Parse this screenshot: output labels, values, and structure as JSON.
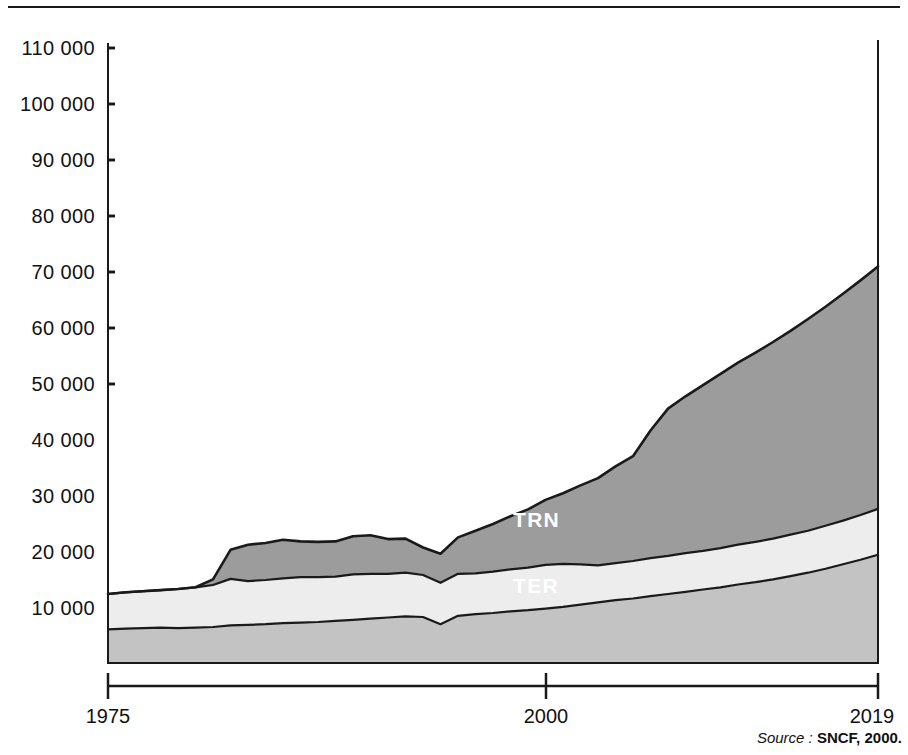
{
  "chart_data": {
    "type": "area",
    "stacked": true,
    "title": "",
    "xlabel": "",
    "ylabel": "",
    "xlim": [
      1975,
      2019
    ],
    "ylim": [
      0,
      110000
    ],
    "x_tick_labels": [
      "1975",
      "2000",
      "2019"
    ],
    "x_ticks": [
      1975,
      2000,
      2019
    ],
    "y_ticks": [
      10000,
      20000,
      30000,
      40000,
      50000,
      60000,
      70000,
      80000,
      90000,
      100000,
      110000
    ],
    "y_tick_labels": [
      "10 000",
      "20 000",
      "30 000",
      "40 000",
      "50 000",
      "60 000",
      "70 000",
      "80 000",
      "90 000",
      "100 000",
      "110 000"
    ],
    "grid": false,
    "legend_position": "inline-area-labels",
    "colors": {
      "TER": "#c3c3c3",
      "TRN": "#ededed",
      "TGV": "#9c9c9c",
      "outline": "#1a1a1a",
      "label_text": "#ffffff"
    },
    "x": [
      1975,
      1976,
      1977,
      1978,
      1979,
      1980,
      1981,
      1982,
      1983,
      1984,
      1985,
      1986,
      1987,
      1988,
      1989,
      1990,
      1991,
      1992,
      1993,
      1994,
      1995,
      1996,
      1997,
      1998,
      1999,
      2000,
      2001,
      2002,
      2003,
      2004,
      2005,
      2006,
      2007,
      2008,
      2009,
      2010,
      2011,
      2012,
      2013,
      2014,
      2015,
      2016,
      2017,
      2018,
      2019
    ],
    "series": [
      {
        "name": "TER",
        "label": "TER",
        "values": [
          6200,
          6300,
          6400,
          6500,
          6400,
          6500,
          6600,
          6900,
          7000,
          7100,
          7300,
          7400,
          7500,
          7700,
          7900,
          8100,
          8300,
          8500,
          8400,
          7100,
          8600,
          8900,
          9100,
          9400,
          9600,
          9900,
          10200,
          10600,
          11000,
          11400,
          11700,
          12100,
          12500,
          12900,
          13300,
          13700,
          14200,
          14600,
          15100,
          15700,
          16300,
          17000,
          17800,
          18600,
          19500
        ]
      },
      {
        "name": "TRN",
        "label": "TRN",
        "values": [
          6300,
          6500,
          6600,
          6700,
          7000,
          7200,
          7500,
          8300,
          7800,
          7900,
          8000,
          8100,
          8000,
          7900,
          8100,
          8000,
          7800,
          7800,
          7500,
          7400,
          7500,
          7300,
          7400,
          7500,
          7600,
          7800,
          7700,
          7200,
          6600,
          6600,
          6700,
          6800,
          6800,
          6900,
          6900,
          7000,
          7100,
          7200,
          7300,
          7400,
          7500,
          7700,
          7800,
          8000,
          8200
        ]
      },
      {
        "name": "TGV",
        "label": "TGV",
        "values": [
          0,
          0,
          0,
          0,
          0,
          0,
          1000,
          5200,
          6500,
          6600,
          6900,
          6400,
          6300,
          6300,
          6800,
          6900,
          6200,
          6100,
          4900,
          5200,
          6500,
          7600,
          8500,
          9500,
          10400,
          11600,
          12600,
          14100,
          15600,
          17300,
          18700,
          22800,
          26300,
          28000,
          29600,
          31100,
          32500,
          33800,
          35100,
          36400,
          37800,
          39100,
          40500,
          41900,
          43300
        ]
      }
    ],
    "totals_note": "Values are stacked; top boundary is the sum of TER + TRN + TGV."
  },
  "axis": {
    "y_labels": [
      "110 000",
      "100 000",
      "90 000",
      "80 000",
      "70 000",
      "60 000",
      "50 000",
      "40 000",
      "30 000",
      "20 000",
      "10 000"
    ],
    "x_labels": [
      "1975",
      "2000",
      "2019"
    ]
  },
  "area_labels": {
    "tgv": "TGV",
    "trn": "TRN",
    "ter": "TER"
  },
  "source": {
    "prefix": "Source :",
    "value": "SNCF, 2000."
  }
}
